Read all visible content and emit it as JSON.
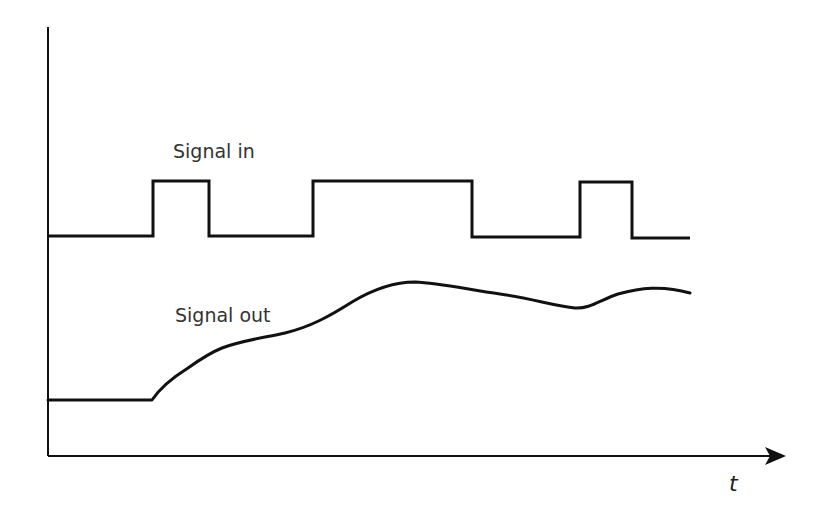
{
  "diagram": {
    "labels": {
      "signal_in": "Signal in",
      "signal_out": "Signal out",
      "time_axis": "t"
    },
    "signal_in": {
      "type": "square-wave",
      "levels": [
        "low",
        "high"
      ],
      "segments": [
        "low",
        "high",
        "low",
        "high",
        "low",
        "high",
        "low"
      ]
    },
    "signal_out": {
      "type": "smoothed-response",
      "description": "flat baseline, then rises with fluctuations tracking the input"
    },
    "colors": {
      "line": "#111111",
      "text": "#333333",
      "background": "#ffffff"
    }
  }
}
